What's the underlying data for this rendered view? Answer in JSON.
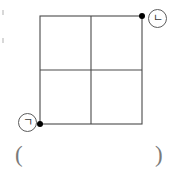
{
  "figure": {
    "caption_region": "geometry-figure",
    "background_color": "#ffffff",
    "stroke_color": "#4a4a4a",
    "vertex_dot_color": "#000000",
    "label_circle_color": "#5c5c5c",
    "paren_color": "#7a7a7a"
  },
  "shape": {
    "name": "square",
    "grid_rows": 2,
    "grid_columns": 2,
    "cell_count": 4,
    "left": 40,
    "top": 16,
    "right": 142,
    "bottom": 124,
    "width": 102,
    "height": 108,
    "center_x": 91,
    "center_y": 70
  },
  "vertices": [
    {
      "id": "vertex-giyeok",
      "label": "ㄱ",
      "position": "bottom-left",
      "x": 40,
      "y": 124,
      "marked": true,
      "dot_radius": 3
    },
    {
      "id": "vertex-nieun",
      "label": "ㄴ",
      "position": "top-right",
      "x": 142,
      "y": 16,
      "marked": true,
      "dot_radius": 3
    }
  ],
  "answer_blank": {
    "open": "(",
    "close": ")",
    "value": ""
  }
}
